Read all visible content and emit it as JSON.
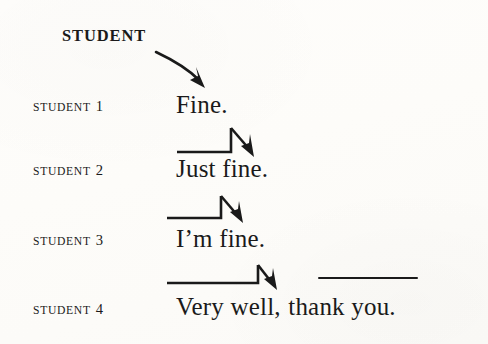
{
  "figure": {
    "background_color": "#fdfcfa",
    "ink_color": "#1a1a1a",
    "column_header": "STUDENT"
  },
  "rows": [
    {
      "label_word": "STUDENT",
      "label_number": "1",
      "utterance": "Fine."
    },
    {
      "label_word": "STUDENT",
      "label_number": "2",
      "utterance": "Just fine."
    },
    {
      "label_word": "STUDENT",
      "label_number": "3",
      "utterance": "I’m fine."
    },
    {
      "label_word": "STUDENT",
      "label_number": "4",
      "utterance_part1": "Very well,",
      "utterance_part2": "thank you."
    }
  ],
  "connectors": {
    "header_arrow": {
      "name": "curved-arrow-header-to-student1",
      "description": "curved arrow from STUDENT header down-right to Fine."
    },
    "elbow_arrows": [
      {
        "name": "elbow-arrow-student1-to-student2"
      },
      {
        "name": "elbow-arrow-student2-to-student3"
      },
      {
        "name": "elbow-arrow-student3-to-student4"
      }
    ],
    "underline": {
      "name": "rule-above-thank-you"
    }
  }
}
